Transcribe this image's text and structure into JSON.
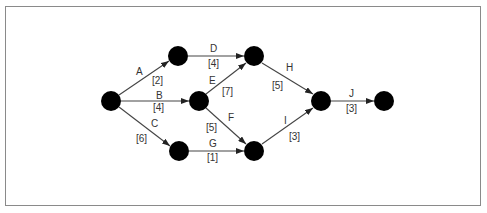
{
  "diagram": {
    "type": "activity-on-arrow network",
    "colors": {
      "node": "#000000",
      "edge": "#444444",
      "text": "#333333",
      "frame": "#8a8a8a"
    },
    "nodes": [
      {
        "id": "1",
        "x": 111,
        "y": 101
      },
      {
        "id": "2",
        "x": 178,
        "y": 56
      },
      {
        "id": "3",
        "x": 199,
        "y": 101
      },
      {
        "id": "4",
        "x": 254,
        "y": 56
      },
      {
        "id": "5",
        "x": 179,
        "y": 151
      },
      {
        "id": "6",
        "x": 254,
        "y": 151
      },
      {
        "id": "7",
        "x": 321,
        "y": 101
      },
      {
        "id": "8",
        "x": 384,
        "y": 101
      }
    ],
    "activities": [
      {
        "name": "A",
        "duration": "[2]",
        "from": "1",
        "to": "2"
      },
      {
        "name": "B",
        "duration": "[4]",
        "from": "1",
        "to": "3"
      },
      {
        "name": "C",
        "duration": "[6]",
        "from": "1",
        "to": "5"
      },
      {
        "name": "D",
        "duration": "[4]",
        "from": "2",
        "to": "4"
      },
      {
        "name": "E",
        "duration": "[7]",
        "from": "3",
        "to": "4"
      },
      {
        "name": "F",
        "duration": "[5]",
        "from": "3",
        "to": "6"
      },
      {
        "name": "G",
        "duration": "[1]",
        "from": "5",
        "to": "6"
      },
      {
        "name": "H",
        "duration": "[5]",
        "from": "4",
        "to": "7"
      },
      {
        "name": "I",
        "duration": "[3]",
        "from": "6",
        "to": "7"
      },
      {
        "name": "J",
        "duration": "[3]",
        "from": "7",
        "to": "8"
      }
    ]
  }
}
